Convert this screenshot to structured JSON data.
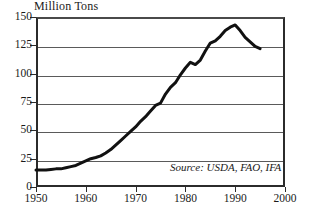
{
  "chart_data": {
    "type": "line",
    "title": "",
    "ylabel": "Million Tons",
    "xlabel": "",
    "xlim": [
      1950,
      2000
    ],
    "ylim": [
      0,
      150
    ],
    "grid": true,
    "legend": null,
    "yticks": [
      150,
      125,
      100,
      75,
      50,
      25,
      0
    ],
    "xticks": [
      1950,
      1960,
      1970,
      1980,
      1990,
      2000
    ],
    "annotations": [
      "Source: USDA, FAO, IFA"
    ],
    "series": [
      {
        "name": "World Fertilizer Use",
        "x": [
          1950,
          1951,
          1952,
          1953,
          1954,
          1955,
          1956,
          1957,
          1958,
          1959,
          1960,
          1961,
          1962,
          1963,
          1964,
          1965,
          1966,
          1967,
          1968,
          1969,
          1970,
          1971,
          1972,
          1973,
          1974,
          1975,
          1976,
          1977,
          1978,
          1979,
          1980,
          1981,
          1982,
          1983,
          1984,
          1985,
          1986,
          1987,
          1988,
          1989,
          1990,
          1991,
          1992,
          1993,
          1994,
          1995
        ],
        "values": [
          15,
          15,
          15,
          15.5,
          16,
          16,
          17,
          18,
          19,
          21,
          23,
          25,
          26,
          27.5,
          30,
          33,
          37,
          41,
          45,
          49,
          53,
          58,
          62,
          67,
          72,
          74,
          82,
          88,
          92,
          99,
          105,
          110,
          108,
          112,
          120,
          127,
          129,
          133,
          138,
          141,
          143,
          138,
          132,
          128,
          124,
          122
        ]
      }
    ]
  },
  "axis": {
    "y_title": "Million Tons",
    "y_labels": [
      "150",
      "125",
      "100",
      "75",
      "50",
      "25",
      "0"
    ],
    "x_labels": [
      "1950",
      "1960",
      "1970",
      "1980",
      "1990",
      "2000"
    ]
  },
  "source": {
    "text": "Source: USDA, FAO, IFA"
  }
}
